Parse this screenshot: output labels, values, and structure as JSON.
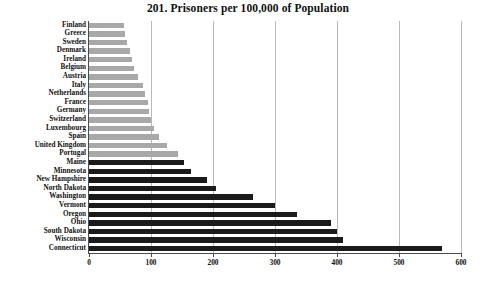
{
  "chart_data": {
    "type": "bar",
    "orientation": "horizontal",
    "title": "201. Prisoners per 100,000 of Population",
    "xlabel": "",
    "ylabel": "",
    "xlim": [
      0,
      600
    ],
    "xticks": [
      0,
      100,
      200,
      300,
      400,
      500,
      600
    ],
    "grid": true,
    "legend": null,
    "categories": [
      "Finland",
      "Greece",
      "Sweden",
      "Denmark",
      "Ireland",
      "Belgium",
      "Austria",
      "Italy",
      "Netherlands",
      "France",
      "Germany",
      "Switzerland",
      "Luxembourg",
      "Spain",
      "United Kingdom",
      "Portugal",
      "Maine",
      "Minnesota",
      "New Hampshire",
      "North Dakota",
      "Washington",
      "Vermont",
      "Oregon",
      "Ohio",
      "South Dakota",
      "Wisconsin",
      "Connecticut"
    ],
    "values": [
      56,
      58,
      61,
      66,
      69,
      73,
      79,
      87,
      91,
      95,
      97,
      100,
      105,
      113,
      125,
      143,
      153,
      165,
      190,
      205,
      265,
      300,
      335,
      390,
      400,
      410,
      570
    ],
    "bar_colors": [
      "#a8a8a8",
      "#a8a8a8",
      "#a8a8a8",
      "#a8a8a8",
      "#a8a8a8",
      "#a8a8a8",
      "#a8a8a8",
      "#a8a8a8",
      "#a8a8a8",
      "#a8a8a8",
      "#a8a8a8",
      "#a8a8a8",
      "#a8a8a8",
      "#a8a8a8",
      "#a8a8a8",
      "#a8a8a8",
      "#1a1a1a",
      "#1a1a1a",
      "#1a1a1a",
      "#1a1a1a",
      "#1a1a1a",
      "#1a1a1a",
      "#1a1a1a",
      "#1a1a1a",
      "#1a1a1a",
      "#1a1a1a",
      "#1a1a1a"
    ]
  },
  "colors": {
    "light_bar": "#a8a8a8",
    "dark_bar": "#1a1a1a",
    "gridline": "#b9b9b9",
    "axis": "#4a4a4a",
    "text": "#111111",
    "background": "#ffffff"
  }
}
